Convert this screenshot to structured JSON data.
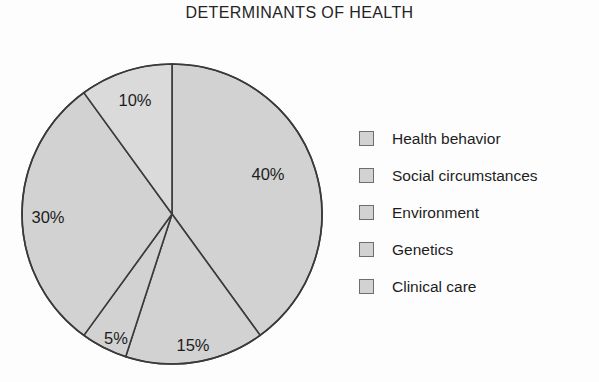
{
  "chart_data": {
    "type": "pie",
    "title": "DETERMINANTS OF HEALTH",
    "categories": [
      "Health behavior",
      "Social circumstances",
      "Environment",
      "Genetics",
      "Clinical care"
    ],
    "values": [
      40,
      15,
      5,
      30,
      10
    ],
    "value_labels": [
      "40%",
      "15%",
      "5%",
      "30%",
      "10%"
    ],
    "units": "percent",
    "total": 100,
    "start_angle_deg": 0,
    "direction": "clockwise",
    "legend_position": "right",
    "grid": false,
    "xlabel": "",
    "ylabel": "",
    "colors": [
      "#d2d2d2",
      "#d2d2d2",
      "#d2d2d2",
      "#d2d2d2",
      "#dadada"
    ],
    "outline_color": "#3a3a3a"
  },
  "title": {
    "text": "DETERMINANTS OF HEALTH"
  },
  "pie": {
    "slices": [
      {
        "label": "40%",
        "name": "Health behavior",
        "value": 40,
        "fill": "#d2d2d2",
        "path": "M 154 158 L 154 8 A 150 150 0 0 1 242 280 Z",
        "label_x": 112,
        "label_y": 118
      },
      {
        "label": "15%",
        "name": "Social circumstances",
        "value": 15,
        "fill": "#d2d2d2",
        "path": "M 154 158 L 242 280 A 150 150 0 0 1 142 307 Z",
        "label_x": 22,
        "label_y": 285
      },
      {
        "label": "5%",
        "name": "Environment",
        "value": 5,
        "fill": "#d2d2d2",
        "path": "M 154 158 L 142 307 A 150 150 0 0 1 98 297 Z",
        "label_x": -48,
        "label_y": 280
      },
      {
        "label": "30%",
        "name": "Genetics",
        "value": 30,
        "fill": "#d2d2d2",
        "path": "M 154 158 L 98 297 A 150 150 0 0 1 66 52 Z",
        "label_x": -140,
        "label_y": 162
      },
      {
        "label": "10%",
        "name": "Clinical care",
        "value": 10,
        "fill": "#dadada",
        "path": "M 154 158 L 66 52 A 150 150 0 0 1 154 8 Z",
        "label_x": -58,
        "label_y": 40
      }
    ]
  },
  "legend": {
    "items": [
      {
        "label": "Health behavior"
      },
      {
        "label": "Social circumstances"
      },
      {
        "label": "Environment"
      },
      {
        "label": "Genetics"
      },
      {
        "label": "Clinical care"
      }
    ]
  }
}
